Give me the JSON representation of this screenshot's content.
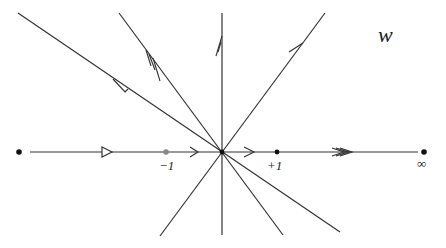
{
  "diagram": {
    "title_label": "w",
    "points": [
      {
        "name": "left-end",
        "label": ""
      },
      {
        "name": "minus-one",
        "label": "−1"
      },
      {
        "name": "origin",
        "label": ""
      },
      {
        "name": "plus-one",
        "label": "+1"
      },
      {
        "name": "infinity",
        "label": "∞"
      }
    ],
    "lines": [
      {
        "name": "real-axis",
        "arrows": [
          "open-triangle",
          "single-chevron",
          "single-chevron",
          "triple-chevron"
        ]
      },
      {
        "name": "imaginary-axis",
        "arrows": [
          "double-half-barb"
        ]
      },
      {
        "name": "shallow-diagonal",
        "arrows": [
          "open-triangle"
        ]
      },
      {
        "name": "steep-diagonal",
        "arrows": [
          "triple-half-barb"
        ]
      },
      {
        "name": "rising-diagonal",
        "arrows": [
          "single-half-barb"
        ]
      }
    ],
    "colors": {
      "line": "#333333",
      "point": "#111111",
      "minus_one_point": "#888888"
    }
  }
}
